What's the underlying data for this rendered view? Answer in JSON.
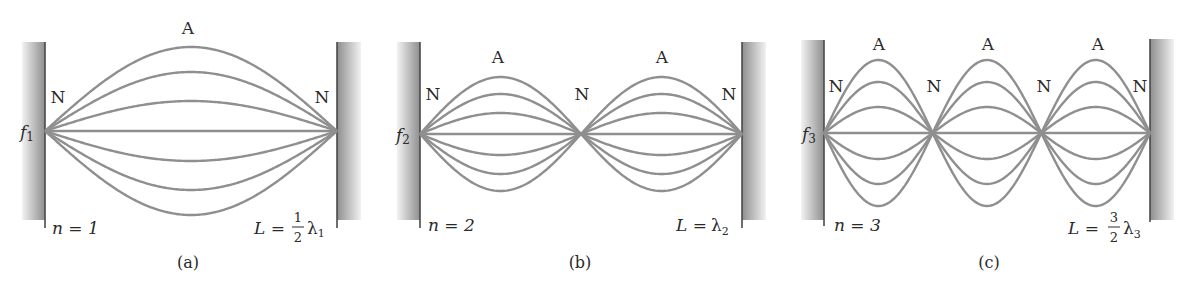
{
  "figure": {
    "colors": {
      "string": "#8f8f8f",
      "wall_dark": "#4a4a4a",
      "wall_gradient_start": "#9a9a9a",
      "wall_gradient_end": "#f2f2f2",
      "text": "#2a2a2a"
    },
    "panels": [
      {
        "id": "a",
        "caption": "(a)",
        "freq_label": "f",
        "freq_sub": "1",
        "mode_label": "n = 1",
        "length_label_prefix": "L =",
        "length_numerator": "1",
        "length_denominator": "2",
        "length_lambda": "λ",
        "length_lambda_sub": "1",
        "node_label": "N",
        "antinode_label": "A",
        "loops": 1,
        "x_start": 45,
        "x_end": 337,
        "midline_y": 131,
        "amplitudes": [
          84,
          59,
          30
        ]
      },
      {
        "id": "b",
        "caption": "(b)",
        "freq_label": "f",
        "freq_sub": "2",
        "mode_label": "n = 2",
        "length_label_prefix": "L =",
        "length_numerator": "",
        "length_denominator": "",
        "length_lambda": "λ",
        "length_lambda_sub": "2",
        "node_label": "N",
        "antinode_label": "A",
        "loops": 2,
        "x_start": 420,
        "x_end": 742,
        "midline_y": 134,
        "amplitudes": [
          57,
          40,
          21
        ]
      },
      {
        "id": "c",
        "caption": "(c)",
        "freq_label": "f",
        "freq_sub": "3",
        "mode_label": "n = 3",
        "length_label_prefix": "L =",
        "length_numerator": "3",
        "length_denominator": "2",
        "length_lambda": "λ",
        "length_lambda_sub": "3",
        "node_label": "N",
        "antinode_label": "A",
        "loops": 3,
        "x_start": 824,
        "x_end": 1150,
        "midline_y": 133,
        "amplitudes": [
          73,
          51,
          26
        ]
      }
    ]
  }
}
